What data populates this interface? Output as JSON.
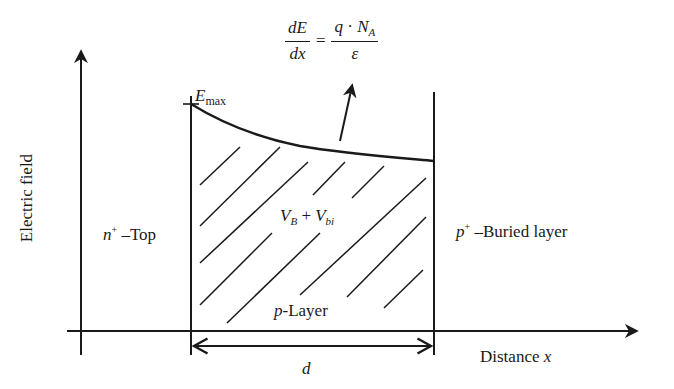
{
  "diagram": {
    "type": "electric-field-profile",
    "y_axis_label": "Electric field",
    "x_axis_label_text": "Distance ",
    "x_axis_label_var": "x",
    "equation": {
      "lhs_num": "dE",
      "lhs_den": "dx",
      "equals": "=",
      "rhs_num_q": "q",
      "rhs_num_dot": " · ",
      "rhs_num_N": "N",
      "rhs_num_sub": "A",
      "rhs_den": "ε"
    },
    "emax": {
      "E": "E",
      "sub": "max"
    },
    "regions": {
      "left": {
        "var": "n",
        "sup": "+",
        "text": " –Top"
      },
      "middle": {
        "var": "p",
        "text": "-Layer"
      },
      "right": {
        "var": "p",
        "sup": "+",
        "text": " –Buried layer"
      }
    },
    "voltage": {
      "V1": "V",
      "sub1": "B",
      "plus": " + ",
      "V2": "V",
      "sub2": "bi"
    },
    "width_label": "d",
    "colors": {
      "line": "#1a1a1a",
      "background": "#ffffff"
    }
  }
}
